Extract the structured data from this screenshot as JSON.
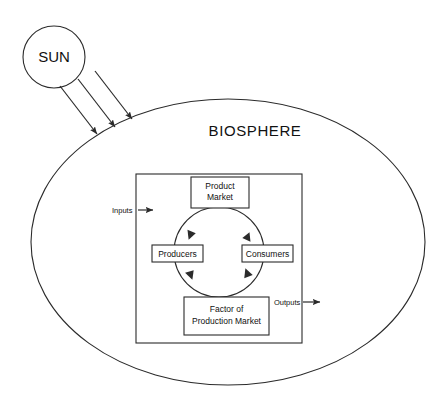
{
  "diagram": {
    "title_visible": false,
    "background_color": "#ffffff",
    "line_color": "#2b2b2b",
    "sun": {
      "label": "SUN"
    },
    "biosphere": {
      "label": "BIOSPHERE"
    },
    "sun_rays": {
      "count": 3,
      "icon": "arrow-down-right-icon"
    },
    "economy_boundary": {
      "name": "economy-rectangle"
    },
    "flow_labels": {
      "inputs": "Inputs",
      "outputs": "Outputs"
    },
    "boxes": [
      {
        "id": "product-market",
        "lines": [
          "Product",
          "Market"
        ]
      },
      {
        "id": "producers",
        "lines": [
          "Producers"
        ]
      },
      {
        "id": "consumers",
        "lines": [
          "Consumers"
        ]
      },
      {
        "id": "factor-of-production-market",
        "lines": [
          "Factor of",
          "Production Market"
        ]
      }
    ],
    "circular_flow": {
      "name": "circular-flow-circle",
      "direction": "clockwise",
      "arrow_count": 4
    }
  }
}
